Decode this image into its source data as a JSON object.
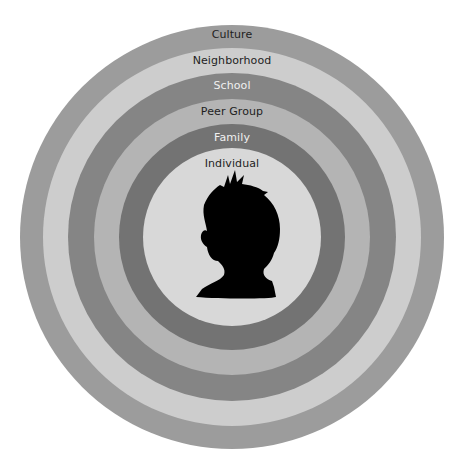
{
  "diagram": {
    "type": "concentric-circles",
    "center": {
      "x": 232,
      "y": 237
    },
    "rings": [
      {
        "label": "Culture",
        "radius": 212,
        "color": "#9c9c9c",
        "text_color": "#1e1e1e",
        "label_top": 28
      },
      {
        "label": "Neighborhood",
        "radius": 189,
        "color": "#cdcdcd",
        "text_color": "#1e1e1e",
        "label_top": 54
      },
      {
        "label": "School",
        "radius": 164,
        "color": "#858585",
        "text_color": "#f0f0f0",
        "label_top": 79
      },
      {
        "label": "Peer Group",
        "radius": 138,
        "color": "#b4b4b4",
        "text_color": "#1e1e1e",
        "label_top": 105
      },
      {
        "label": "Family",
        "radius": 113,
        "color": "#737373",
        "text_color": "#f0f0f0",
        "label_top": 131
      },
      {
        "label": "Individual",
        "radius": 89,
        "color": "#d8d8d8",
        "text_color": "#1e1e1e",
        "label_top": 157
      }
    ],
    "center_icon": "child-head-silhouette-icon"
  }
}
